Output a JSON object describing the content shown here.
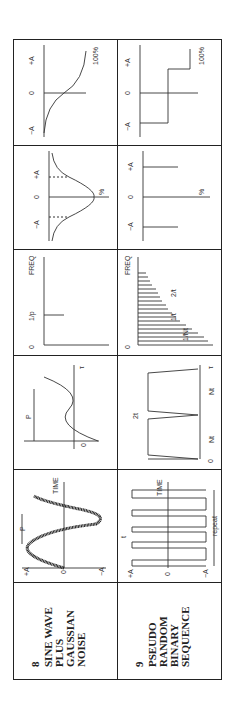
{
  "table": {
    "rows": [
      {
        "number": "8",
        "name_lines": [
          "SINE WAVE",
          "PLUS",
          "GAUSSIAN",
          "NOISE"
        ],
        "time_history": {
          "label_pos": "+A",
          "label_zero": "0",
          "label_neg": "−A",
          "period": "P",
          "axis": "TIME"
        },
        "autocorrelation": {
          "period": "P",
          "zero": "0",
          "tau": "τ"
        },
        "psd": {
          "zero": "0",
          "freq_label": "1/p",
          "axis": "FREQ"
        },
        "amplitude_distribution": {
          "percent": "%",
          "neg": "−A",
          "neg_sub": "max",
          "zero": "0",
          "pos": "+A",
          "pos_sub": "max"
        },
        "cumulative_distribution": {
          "percent": "100%",
          "neg": "−A",
          "zero": "0",
          "pos": "+A"
        }
      },
      {
        "number": "9",
        "name_lines": [
          "PSEUDO",
          "RANDOM",
          "BINARY",
          "SEQUENCE"
        ],
        "time_history": {
          "label_pos": "+A",
          "label_zero": "0",
          "label_neg": "−A",
          "t": "t",
          "repeat": "repeat",
          "axis": "TIME"
        },
        "autocorrelation": {
          "two_t": "2t",
          "nt1": "Nt",
          "nt2": "Nt",
          "zero": "0",
          "tau": "τ"
        },
        "psd": {
          "zero": "0",
          "inv_nt": "1/Nt",
          "inv_t": "1/t",
          "two_inv_t": "2/t",
          "axis": "FREQ"
        },
        "amplitude_distribution": {
          "percent": "%",
          "neg": "−A",
          "zero": "0",
          "pos": "+A"
        },
        "cumulative_distribution": {
          "percent": "100%",
          "neg": "−A",
          "zero": "0",
          "pos": "+A"
        }
      }
    ]
  }
}
